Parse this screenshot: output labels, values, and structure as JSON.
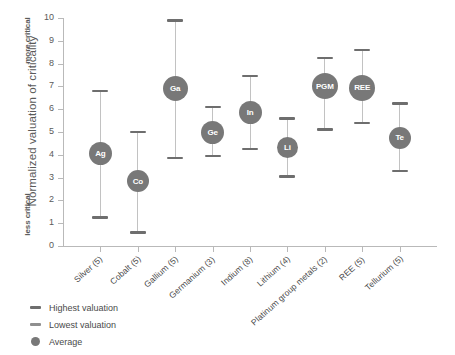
{
  "chart_data": {
    "type": "scatter",
    "title": "",
    "xlabel": "",
    "ylabel": "Normalized valuation of criticality",
    "ylim": [
      0,
      10
    ],
    "yticks": [
      0,
      1,
      2,
      3,
      4,
      5,
      6,
      7,
      8,
      9,
      10
    ],
    "axis_end_labels": {
      "top": "more critical",
      "bottom": "less critical"
    },
    "grid": false,
    "legend_position": "bottom-left",
    "categories": [
      "Silver (5)",
      "Cobalt (5)",
      "Gallium (5)",
      "Germanium (3)",
      "Indium (8)",
      "Lithium (4)",
      "Platinum group metals (2)",
      "REE (5)",
      "Tellurium (5)"
    ],
    "bubble_labels": [
      "Ag",
      "Co",
      "Ga",
      "Ge",
      "In",
      "Li",
      "PGM",
      "REE",
      "Te"
    ],
    "series": [
      {
        "name": "Highest valuation",
        "values": [
          6.8,
          5.0,
          9.9,
          6.1,
          7.45,
          5.6,
          8.25,
          8.6,
          6.25
        ]
      },
      {
        "name": "Lowest valuation",
        "values": [
          1.25,
          0.6,
          3.85,
          3.95,
          4.25,
          3.05,
          5.1,
          5.4,
          3.3
        ]
      },
      {
        "name": "Average",
        "values": [
          4.05,
          2.85,
          6.9,
          5.0,
          5.85,
          4.3,
          7.0,
          6.95,
          4.75
        ]
      }
    ],
    "colors": {
      "marker": "#6e6e6e",
      "bubble": "#787878",
      "line": "#c2c2c2",
      "axis": "#b9b9b9",
      "text": "#4a4a4a"
    }
  },
  "legend": {
    "items": [
      {
        "label": "Highest valuation",
        "marker": "dash"
      },
      {
        "label": "Lowest valuation",
        "marker": "dash-light"
      },
      {
        "label": "Average",
        "marker": "dot"
      }
    ]
  }
}
